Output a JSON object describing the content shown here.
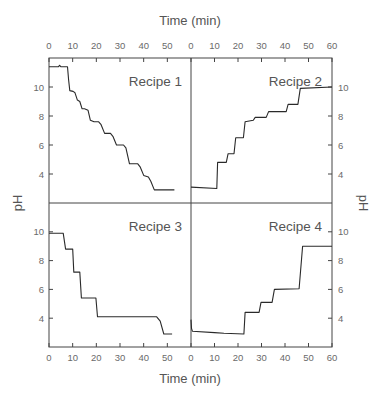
{
  "chart_data": {
    "type": "line",
    "layout": "2x2 panels sharing axes",
    "top_xlabel": "Time (min)",
    "bottom_xlabel": "Time (min)",
    "left_ylabel": "pH",
    "right_ylabel": "pH",
    "x_ticks_left": [
      "0",
      "10",
      "20",
      "30",
      "40",
      "50"
    ],
    "x_ticks_right": [
      "0",
      "10",
      "20",
      "30",
      "40",
      "50",
      "60"
    ],
    "y_ticks": [
      "4",
      "6",
      "8",
      "10"
    ],
    "xlim": [
      0,
      60
    ],
    "ylim": [
      2,
      12
    ],
    "grid": false,
    "legend": "none (panel titles)",
    "panels": [
      {
        "title": "Recipe 1",
        "position": "top-left",
        "x": [
          0,
          4,
          4.5,
          5,
          7.8,
          8.3,
          8.8,
          10.2,
          11,
          12,
          13,
          14,
          15,
          16.5,
          17.5,
          19,
          21,
          22,
          23.5,
          26,
          27,
          28.5,
          31.5,
          32.5,
          34,
          37.5,
          38.5,
          40,
          42,
          43,
          44.5,
          46,
          53
        ],
        "y": [
          11.4,
          11.4,
          11.5,
          11.4,
          11.4,
          10.5,
          9.75,
          9.7,
          9.6,
          9.1,
          9.0,
          8.5,
          8.5,
          8.4,
          7.7,
          7.6,
          7.6,
          7.4,
          6.8,
          6.8,
          6.6,
          6.0,
          6.0,
          5.8,
          4.7,
          4.7,
          4.5,
          3.9,
          3.8,
          3.5,
          2.9,
          2.9,
          2.9
        ]
      },
      {
        "title": "Recipe 2",
        "position": "top-right",
        "x": [
          0,
          11,
          11.3,
          15,
          15.8,
          18.3,
          19,
          22.3,
          23,
          26.5,
          27.3,
          32,
          33,
          40.5,
          41.3,
          45.5,
          46.5,
          60
        ],
        "y": [
          3.1,
          3.0,
          4.8,
          4.8,
          5.4,
          5.4,
          6.5,
          6.5,
          7.6,
          7.7,
          7.9,
          7.9,
          8.3,
          8.3,
          8.8,
          8.8,
          9.9,
          10.0
        ]
      },
      {
        "title": "Recipe 3",
        "position": "bottom-left",
        "x": [
          0,
          6,
          7,
          10,
          10.5,
          13,
          13.7,
          19.8,
          20.5,
          45.5,
          47,
          48.5,
          52
        ],
        "y": [
          9.9,
          9.9,
          8.8,
          8.8,
          7.2,
          7.2,
          5.4,
          5.4,
          4.1,
          4.1,
          3.8,
          2.9,
          2.9
        ]
      },
      {
        "title": "Recipe 4",
        "position": "bottom-right",
        "x": [
          0,
          0.2,
          0.6,
          10,
          14,
          22.5,
          23,
          29,
          29.8,
          34.5,
          35.5,
          46,
          47.5,
          60
        ],
        "y": [
          3.9,
          3.3,
          3.1,
          3.0,
          2.95,
          2.9,
          4.4,
          4.4,
          5.1,
          5.1,
          6.0,
          6.05,
          9.0,
          9.0
        ]
      }
    ]
  }
}
